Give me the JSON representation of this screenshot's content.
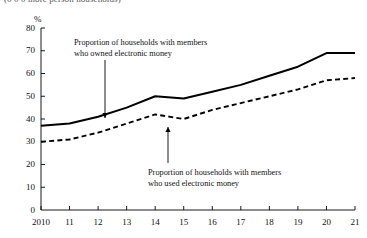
{
  "figure": {
    "clipped_header": "(0 0 0 more person households)",
    "unit_label": "%"
  },
  "annotations": {
    "owned": {
      "line1": "Proportion of households with members",
      "line2": "who owned electronic money"
    },
    "used": {
      "line1": "Proportion of households with members",
      "line2": "who used electronic money"
    }
  },
  "colors": {
    "axis": "#000000",
    "owned_line": "#000000",
    "used_line": "#000000",
    "background": "#ffffff"
  },
  "chart_data": {
    "type": "line",
    "title": "",
    "xlabel": "",
    "ylabel": "%",
    "ylim": [
      0,
      80
    ],
    "ytick_step": 10,
    "yticks": [
      0,
      10,
      20,
      30,
      40,
      50,
      60,
      70,
      80
    ],
    "categories": [
      "2010",
      "11",
      "12",
      "13",
      "14",
      "15",
      "16",
      "17",
      "18",
      "19",
      "20",
      "21"
    ],
    "grid": false,
    "legend_position": "annotations",
    "series": [
      {
        "name": "Proportion of households with members who owned electronic money",
        "style": "solid",
        "values": [
          37,
          38,
          41,
          45,
          50,
          49,
          52,
          55,
          59,
          63,
          69,
          69
        ]
      },
      {
        "name": "Proportion of households with members who used electronic money",
        "style": "dashed",
        "values": [
          30,
          31,
          34,
          38,
          42,
          40,
          44,
          47,
          50,
          53,
          57,
          58
        ]
      }
    ]
  }
}
